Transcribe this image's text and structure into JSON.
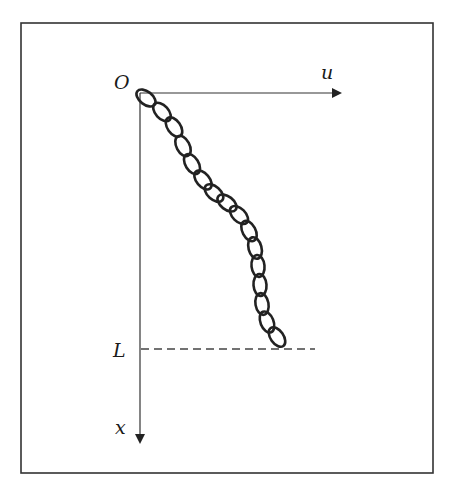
{
  "diagram": {
    "type": "hanging-chain-coordinate-diagram",
    "frame": {
      "x": 21,
      "y": 23,
      "width": 412,
      "height": 450,
      "stroke": "#333333"
    },
    "origin": {
      "label": "O",
      "x": 140,
      "y": 93
    },
    "axes": {
      "horizontal": {
        "label": "u",
        "from": [
          140,
          93
        ],
        "to": [
          340,
          93
        ]
      },
      "vertical": {
        "label": "x",
        "from": [
          140,
          93
        ],
        "to": [
          140,
          442
        ]
      }
    },
    "length_marker": {
      "label": "L",
      "y": 349,
      "x_from": 141,
      "x_to": 315,
      "style": "dashed"
    },
    "chain": {
      "description": "chain of oval links hanging from origin down to depth L",
      "link_count": 16,
      "links": [
        {
          "cx": 146,
          "cy": 98,
          "angle": 38
        },
        {
          "cx": 162,
          "cy": 112,
          "angle": 48
        },
        {
          "cx": 174,
          "cy": 127,
          "angle": 55
        },
        {
          "cx": 183,
          "cy": 146,
          "angle": 62
        },
        {
          "cx": 192,
          "cy": 164,
          "angle": 58
        },
        {
          "cx": 203,
          "cy": 180,
          "angle": 50
        },
        {
          "cx": 214,
          "cy": 193,
          "angle": 42
        },
        {
          "cx": 227,
          "cy": 203,
          "angle": 38
        },
        {
          "cx": 239,
          "cy": 215,
          "angle": 45
        },
        {
          "cx": 249,
          "cy": 231,
          "angle": 62
        },
        {
          "cx": 255,
          "cy": 248,
          "angle": 75
        },
        {
          "cx": 258,
          "cy": 266,
          "angle": 84
        },
        {
          "cx": 260,
          "cy": 285,
          "angle": 86
        },
        {
          "cx": 262,
          "cy": 304,
          "angle": 80
        },
        {
          "cx": 267,
          "cy": 322,
          "angle": 68
        },
        {
          "cx": 277,
          "cy": 337,
          "angle": 55
        }
      ],
      "stroke": "#222222"
    },
    "colors": {
      "line": "#333333",
      "text": "#1a1a1a",
      "background": "#ffffff"
    }
  }
}
